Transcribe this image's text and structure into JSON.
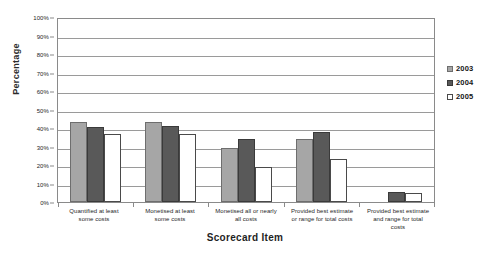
{
  "chart_data": {
    "type": "bar",
    "title": "",
    "xlabel": "Scorecard Item",
    "ylabel": "Percentage",
    "ylim": [
      0,
      100
    ],
    "grid": true,
    "legend_position": "right",
    "y_tick_labels": [
      "100%",
      "90%",
      "80%",
      "70%",
      "60%",
      "50%",
      "40%",
      "30%",
      "20%",
      "10%",
      "0%"
    ],
    "y_tick_values": [
      100,
      90,
      80,
      70,
      60,
      50,
      40,
      30,
      20,
      10,
      0
    ],
    "categories": [
      "Quantified at least some costs",
      "Monetised at least some costs",
      "Monetised all or nearly all costs",
      "Provided best estimate or range for total costs",
      "Provided best estimate and range for total costs"
    ],
    "category_lines": [
      [
        "Quantified at least",
        "some costs"
      ],
      [
        "Monetised at least",
        "some costs"
      ],
      [
        "Monetised all or nearly",
        "all costs"
      ],
      [
        "Provided best estimate",
        "or range for total costs"
      ],
      [
        "Provided best estimate",
        "and range for total",
        "costs"
      ]
    ],
    "series": [
      {
        "name": "2003",
        "color": "#a6a6a6",
        "values": [
          43,
          43,
          29,
          34,
          0
        ]
      },
      {
        "name": "2004",
        "color": "#595959",
        "values": [
          40.5,
          41,
          34,
          38,
          5.5
        ]
      },
      {
        "name": "2005",
        "color": "#ffffff",
        "values": [
          36.5,
          36.5,
          19,
          23.5,
          5
        ]
      }
    ]
  }
}
